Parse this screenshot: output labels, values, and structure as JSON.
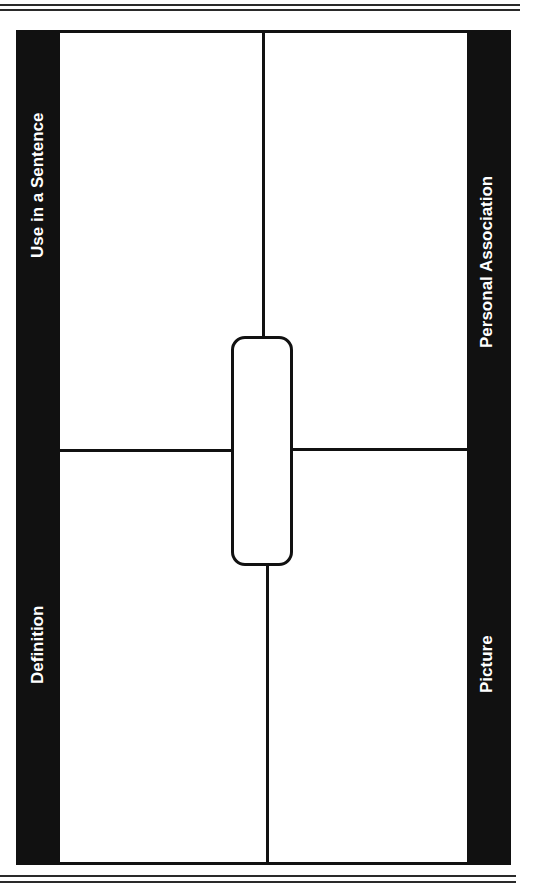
{
  "document": {
    "type": "Frayer model graphic organizer",
    "quadrants": {
      "top_left": "Use in a Sentence",
      "bottom_left": "Definition",
      "top_right": "Personal Association",
      "bottom_right": "Picture"
    },
    "center_box": {
      "label": ""
    }
  },
  "colors": {
    "band": "#111111",
    "background": "#ffffff",
    "label_text": "#ffffff"
  }
}
